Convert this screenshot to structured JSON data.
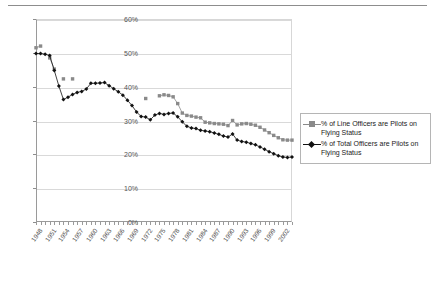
{
  "chart_data": {
    "type": "line",
    "title": "",
    "xlabel": "",
    "ylabel": "",
    "ylim": [
      0,
      60
    ],
    "ytick_labels": [
      "0%",
      "10%",
      "20%",
      "30%",
      "40%",
      "50%",
      "60%"
    ],
    "ytick_values": [
      0,
      10,
      20,
      30,
      40,
      50,
      60
    ],
    "grid": true,
    "legend_position": "right",
    "xlim": [
      1948,
      2004
    ],
    "x_tick_step": 3,
    "xtick_labels": [
      "1948",
      "1951",
      "1954",
      "1957",
      "1960",
      "1963",
      "1966",
      "1969",
      "1972",
      "1975",
      "1978",
      "1981",
      "1984",
      "1987",
      "1990",
      "1993",
      "1996",
      "1999",
      "2002"
    ],
    "x": [
      1948,
      1949,
      1950,
      1951,
      1952,
      1953,
      1954,
      1955,
      1956,
      1957,
      1958,
      1959,
      1960,
      1961,
      1962,
      1963,
      1964,
      1965,
      1966,
      1967,
      1968,
      1969,
      1970,
      1971,
      1972,
      1973,
      1974,
      1975,
      1976,
      1977,
      1978,
      1979,
      1980,
      1981,
      1982,
      1983,
      1984,
      1985,
      1986,
      1987,
      1988,
      1989,
      1990,
      1991,
      1992,
      1993,
      1994,
      1995,
      1996,
      1997,
      1998,
      1999,
      2000,
      2001,
      2002,
      2003,
      2004
    ],
    "series": [
      {
        "name": "% of Line Officers are Pilots on Flying Status",
        "color": "#8a8a8a",
        "marker": "square",
        "values": [
          51.5,
          52.0,
          null,
          48.5,
          45.2,
          null,
          42.3,
          null,
          42.3,
          null,
          null,
          null,
          null,
          null,
          null,
          null,
          null,
          null,
          null,
          null,
          null,
          null,
          null,
          null,
          36.5,
          null,
          null,
          37.3,
          37.6,
          37.4,
          37.0,
          35.0,
          32.2,
          31.5,
          31.3,
          31.0,
          30.8,
          29.5,
          29.3,
          29.1,
          29.0,
          28.9,
          28.5,
          30.0,
          28.7,
          29.0,
          29.1,
          28.9,
          28.6,
          28.0,
          27.2,
          26.4,
          25.6,
          24.9,
          24.3,
          24.2,
          24.2
        ]
      },
      {
        "name": "% of Total Officers are Pilots on Flying Status",
        "color": "#111111",
        "marker": "diamond",
        "values": [
          49.8,
          49.8,
          49.6,
          49.2,
          44.8,
          40.2,
          36.2,
          36.9,
          37.7,
          38.3,
          38.6,
          39.3,
          41.0,
          41.0,
          41.1,
          41.2,
          40.3,
          39.4,
          38.5,
          37.5,
          36.0,
          34.4,
          32.5,
          31.2,
          31.0,
          30.2,
          31.6,
          32.1,
          31.8,
          32.1,
          32.2,
          31.1,
          29.6,
          28.3,
          27.8,
          27.6,
          27.1,
          26.9,
          26.7,
          26.3,
          25.9,
          25.4,
          25.1,
          26.0,
          24.2,
          23.8,
          23.6,
          23.2,
          22.8,
          22.2,
          21.5,
          20.8,
          20.2,
          19.6,
          19.2,
          19.1,
          19.2
        ]
      }
    ]
  },
  "legend": {
    "items": [
      {
        "label": "% of Line Officers are Pilots on Flying Status"
      },
      {
        "label": "% of Total Officers are Pilots on Flying Status"
      }
    ]
  }
}
